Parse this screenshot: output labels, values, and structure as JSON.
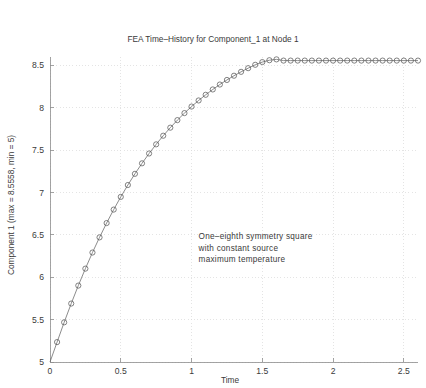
{
  "chart_data": {
    "type": "line",
    "title": "FEA Time–History for Component_1 at Node 1",
    "xlabel": "Time",
    "ylabel": "Component 1 (max = 8.5558, min = 5)",
    "xlim": [
      0,
      2.6
    ],
    "ylim": [
      5,
      8.6
    ],
    "xticks": [
      0,
      0.5,
      1,
      1.5,
      2,
      2.5
    ],
    "xticklabels": [
      "0",
      "0.5",
      "1",
      "1.5",
      "2",
      "2.5"
    ],
    "yticks": [
      5,
      5.5,
      6,
      6.5,
      7,
      7.5,
      8,
      8.5
    ],
    "yticklabels": [
      "5",
      "5.5",
      "6",
      "6.5",
      "7",
      "7.5",
      "8",
      "8.5"
    ],
    "grid": true,
    "legend": null,
    "marker": "circle-open",
    "line_color": "#6f6f6f",
    "marker_color": "#5a5a5a",
    "grid_color": "#d8d8d8",
    "axis_color": "#8d8d8d",
    "annotations": [
      {
        "name": "model-description",
        "x": 1.05,
        "y": 6.45,
        "lines": [
          "One–eighth symmetry square",
          "with constant source",
          "maximum temperature"
        ]
      }
    ],
    "series": [
      {
        "name": "Component_1 at Node 1",
        "x": [
          0,
          0.05,
          0.1,
          0.15,
          0.2,
          0.25,
          0.3,
          0.35,
          0.4,
          0.45,
          0.5,
          0.55,
          0.6,
          0.65,
          0.7,
          0.75,
          0.8,
          0.85,
          0.9,
          0.95,
          1.0,
          1.05,
          1.1,
          1.15,
          1.2,
          1.25,
          1.3,
          1.35,
          1.4,
          1.45,
          1.5,
          1.55,
          1.6,
          1.65,
          1.7,
          1.75,
          1.8,
          1.85,
          1.9,
          1.95,
          2.0,
          2.05,
          2.1,
          2.15,
          2.2,
          2.25,
          2.3,
          2.35,
          2.4,
          2.45,
          2.5,
          2.55,
          2.6
        ],
        "y": [
          5.0,
          5.235,
          5.468,
          5.69,
          5.902,
          6.102,
          6.292,
          6.471,
          6.64,
          6.799,
          6.949,
          7.089,
          7.221,
          7.345,
          7.461,
          7.569,
          7.671,
          7.766,
          7.855,
          7.938,
          8.015,
          8.087,
          8.154,
          8.217,
          8.275,
          8.329,
          8.379,
          8.425,
          8.468,
          8.508,
          8.54,
          8.562,
          8.572,
          8.5576,
          8.5576,
          8.5576,
          8.5576,
          8.5576,
          8.5576,
          8.5576,
          8.5576,
          8.5576,
          8.5576,
          8.5576,
          8.5576,
          8.5576,
          8.5576,
          8.5576,
          8.5576,
          8.5576,
          8.5576,
          8.5576,
          8.5576
        ],
        "max": 8.5558,
        "min": 5
      }
    ]
  }
}
